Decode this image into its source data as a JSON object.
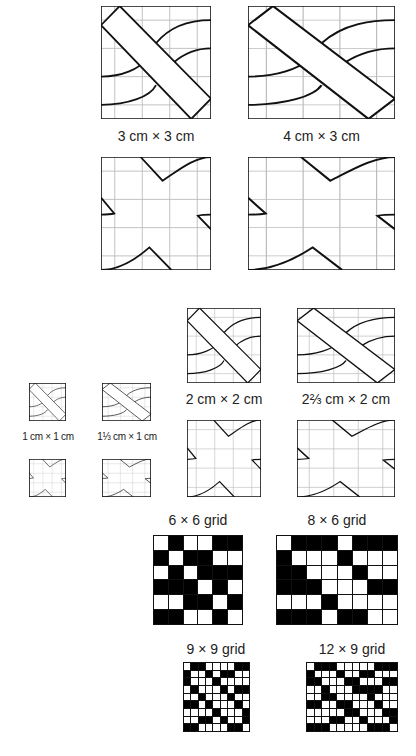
{
  "top_section": {
    "labels": {
      "tile_3x3": "3 cm × 3 cm",
      "tile_4x3": "4 cm × 3 cm"
    }
  },
  "middle_section": {
    "labels": {
      "tile_2x2": "2 cm × 2 cm",
      "tile_2_2_3x2": "2⅔ cm × 2 cm",
      "tile_1x1": "1 cm × 1 cm",
      "tile_1_1_3x1": "1⅓ cm × 1 cm"
    }
  },
  "grids": {
    "g6x6": {
      "label": "6 × 6 grid",
      "cols": 6,
      "rows": 6,
      "cells": [
        [
          0,
          1,
          0,
          0,
          1,
          1
        ],
        [
          1,
          0,
          1,
          1,
          0,
          0
        ],
        [
          0,
          1,
          0,
          1,
          1,
          1
        ],
        [
          1,
          1,
          1,
          0,
          1,
          0
        ],
        [
          0,
          0,
          1,
          1,
          0,
          1
        ],
        [
          1,
          1,
          0,
          0,
          1,
          0
        ]
      ]
    },
    "g8x6": {
      "label": "8 × 6 grid",
      "cols": 8,
      "rows": 6,
      "cells": [
        [
          0,
          1,
          1,
          1,
          0,
          1,
          1,
          1
        ],
        [
          1,
          0,
          0,
          0,
          1,
          0,
          0,
          0
        ],
        [
          1,
          1,
          0,
          0,
          0,
          1,
          0,
          0
        ],
        [
          1,
          1,
          1,
          0,
          0,
          0,
          1,
          1
        ],
        [
          0,
          0,
          0,
          1,
          0,
          0,
          0,
          0
        ],
        [
          1,
          1,
          1,
          0,
          1,
          1,
          0,
          0
        ]
      ]
    },
    "g9x9": {
      "label": "9 × 9 grid",
      "cols": 9,
      "rows": 9,
      "cells": [
        [
          0,
          1,
          1,
          0,
          0,
          0,
          0,
          1,
          1
        ],
        [
          1,
          0,
          0,
          1,
          0,
          1,
          1,
          0,
          0
        ],
        [
          1,
          0,
          0,
          0,
          1,
          0,
          0,
          0,
          0
        ],
        [
          0,
          1,
          0,
          0,
          0,
          1,
          0,
          1,
          1
        ],
        [
          0,
          0,
          1,
          0,
          0,
          0,
          1,
          0,
          0
        ],
        [
          1,
          1,
          0,
          1,
          0,
          0,
          0,
          1,
          0
        ],
        [
          0,
          0,
          0,
          0,
          1,
          0,
          0,
          0,
          1
        ],
        [
          0,
          0,
          1,
          1,
          0,
          1,
          0,
          0,
          1
        ],
        [
          1,
          1,
          0,
          0,
          0,
          0,
          1,
          1,
          0
        ]
      ]
    },
    "g12x9": {
      "label": "12 × 9 grid",
      "cols": 12,
      "rows": 9,
      "cells": [
        [
          0,
          1,
          1,
          1,
          0,
          0,
          0,
          0,
          0,
          1,
          1,
          1
        ],
        [
          1,
          0,
          0,
          0,
          1,
          0,
          0,
          1,
          1,
          0,
          0,
          0
        ],
        [
          1,
          1,
          0,
          0,
          0,
          1,
          1,
          0,
          0,
          0,
          1,
          1
        ],
        [
          0,
          0,
          1,
          0,
          0,
          0,
          1,
          1,
          1,
          1,
          0,
          0
        ],
        [
          0,
          0,
          1,
          1,
          0,
          0,
          0,
          0,
          1,
          0,
          0,
          0
        ],
        [
          1,
          1,
          0,
          0,
          1,
          1,
          0,
          0,
          0,
          1,
          0,
          0
        ],
        [
          0,
          0,
          0,
          0,
          0,
          1,
          1,
          0,
          0,
          0,
          1,
          1
        ],
        [
          0,
          0,
          0,
          1,
          1,
          0,
          0,
          1,
          0,
          0,
          0,
          1
        ],
        [
          1,
          1,
          1,
          0,
          0,
          0,
          0,
          0,
          1,
          1,
          1,
          0
        ]
      ]
    }
  }
}
